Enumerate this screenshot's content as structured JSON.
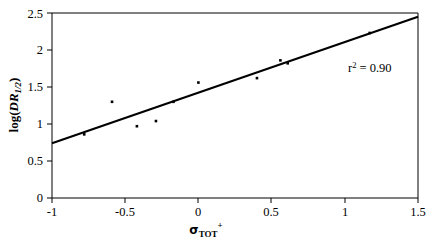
{
  "chart_data": {
    "type": "scatter",
    "title": "",
    "subtitle": "",
    "xlabel": "σTOT+",
    "xlabel_parts": {
      "symbol": "σ",
      "subscript": "TOT",
      "superscript": "+"
    },
    "ylabel": "log(DR1/2)",
    "ylabel_parts": {
      "prefix": "log(",
      "italic": "DR",
      "subscript": "1/2",
      "suffix": ")"
    },
    "xlim": [
      -1,
      1.5
    ],
    "ylim": [
      0,
      2.5
    ],
    "xticks": [
      -1,
      -0.5,
      0,
      0.5,
      1,
      1.5
    ],
    "xtick_labels": [
      "-1",
      "-0.5",
      "0",
      "0.5",
      "1",
      "1.5"
    ],
    "yticks": [
      0,
      0.5,
      1,
      1.5,
      2,
      2.5
    ],
    "ytick_labels": [
      "0",
      "0.5",
      "1",
      "1.5",
      "2",
      "2.5"
    ],
    "grid": false,
    "legend": false,
    "marker": "filled-square",
    "marker_color": "#000000",
    "line_color": "#000000",
    "points": [
      {
        "x": -0.78,
        "y": 0.86
      },
      {
        "x": -0.59,
        "y": 1.3
      },
      {
        "x": -0.42,
        "y": 0.97
      },
      {
        "x": -0.29,
        "y": 1.04
      },
      {
        "x": -0.17,
        "y": 1.3
      },
      {
        "x": 0.0,
        "y": 1.56
      },
      {
        "x": 0.4,
        "y": 1.62
      },
      {
        "x": 0.56,
        "y": 1.86
      },
      {
        "x": 0.61,
        "y": 1.82
      },
      {
        "x": 1.17,
        "y": 2.23
      }
    ],
    "fit_line": {
      "x_start": -1,
      "y_start": 0.74,
      "x_end": 1.5,
      "y_end": 2.45,
      "slope": 0.684,
      "intercept": 1.424
    },
    "annotations": [
      {
        "name": "r-squared-annotation",
        "text": "r2 = 0.90",
        "base": "r",
        "superscript": "2",
        "rest": " = 0.90",
        "x": 1.02,
        "y": 2.07
      }
    ]
  }
}
